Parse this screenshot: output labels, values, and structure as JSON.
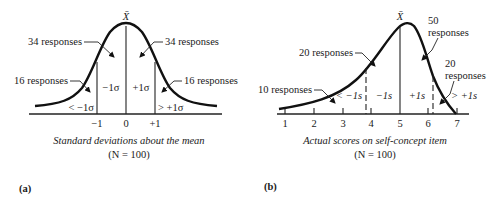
{
  "panel_a": {
    "label": "(a)",
    "mean_symbol": "X̄",
    "annotations": {
      "upper_left": "34 responses",
      "upper_right": "34 responses",
      "lower_left": "16 responses",
      "lower_right": "16 responses"
    },
    "regions": {
      "far_left": "< −1σ",
      "inner_left": "−1σ",
      "inner_right": "+1σ",
      "far_right": "> +1σ"
    },
    "ticks": [
      "−1",
      "0",
      "+1"
    ],
    "caption": "Standard deviations about the mean",
    "n_label": "(N = 100)"
  },
  "panel_b": {
    "label": "(b)",
    "mean_symbol": "X̄",
    "annotations": {
      "peak_label_line1": "50",
      "peak_label_line2": "responses",
      "upper_left": "20 responses",
      "lower_left": "10 responses",
      "right_line1": "20",
      "right_line2": "responses"
    },
    "regions": {
      "far_left": "< −1s",
      "inner_left": "−1s",
      "inner_right": "+1s",
      "far_right": "> +1s"
    },
    "ticks": [
      "1",
      "2",
      "3",
      "4",
      "5",
      "6",
      "7"
    ],
    "caption": "Actual scores on self-concept item",
    "n_label": "(N = 100)"
  },
  "colors": {
    "ink": "#111111",
    "background": "#ffffff"
  }
}
